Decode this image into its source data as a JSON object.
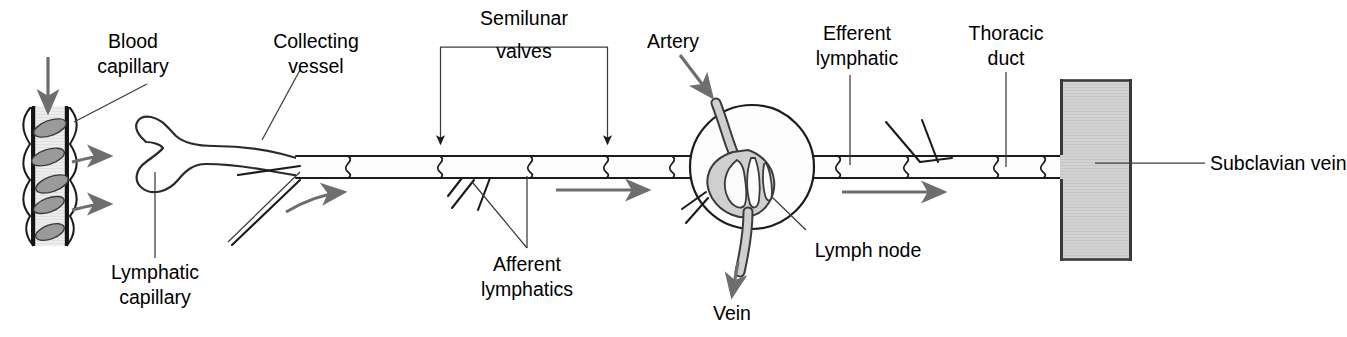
{
  "figure": {
    "background_color": "#ffffff",
    "width": 1347,
    "height": 337
  },
  "colors": {
    "ink": "#1b1b1b",
    "leader_line": "#3b3b3b",
    "arrow_gray": "#6e6e6e",
    "vessel_fill": "#fdfdfd",
    "capillary_fill": "#e4e4e4",
    "capillary_cell": "#9a9a9a",
    "node_sinus_gray": "#cfcfcf",
    "subclavian_vein_fill": "#cdcdcd",
    "subclavian_vein_border": "#3a3a3a"
  },
  "labels": {
    "blood_capillary": {
      "line1": "Blood",
      "line2": "capillary"
    },
    "lymphatic_capillary": {
      "line1": "Lymphatic",
      "line2": "capillary"
    },
    "collecting_vessel": {
      "line1": "Collecting",
      "line2": "vessel"
    },
    "semilunar_valves": {
      "line1": "Semilunar",
      "line2": "valves"
    },
    "afferent_lymphatics": {
      "line1": "Afferent",
      "line2": "lymphatics"
    },
    "artery": {
      "line1": "Artery"
    },
    "vein": {
      "line1": "Vein"
    },
    "lymph_node": {
      "line1": "Lymph node"
    },
    "efferent_lymphatic": {
      "line1": "Efferent",
      "line2": "lymphatic"
    },
    "thoracic_duct": {
      "line1": "Thoracic",
      "line2": "duct"
    },
    "subclavian_vein": {
      "line1": "Subclavian vein"
    }
  },
  "structures": {
    "blood_capillary": {
      "name": "blood-capillary",
      "cell_count": 5,
      "flow_in_arrow": "down",
      "exit_arrows": 2
    },
    "lymphatic_capillary": {
      "name": "lymphatic-capillary",
      "blind_ended": true,
      "lobes": 2
    },
    "collecting_vessel": {
      "name": "collecting-vessel",
      "valve_count": 7
    },
    "lymph_node": {
      "name": "lymph-node",
      "artery_label": "Artery",
      "vein_label": "Vein",
      "sinus_loops": 3
    },
    "subclavian_vein": {
      "name": "subclavian-vein",
      "orientation": "vertical"
    }
  },
  "flow_arrows": {
    "count": 4,
    "direction": "left-to-right",
    "color": "#6e6e6e"
  }
}
